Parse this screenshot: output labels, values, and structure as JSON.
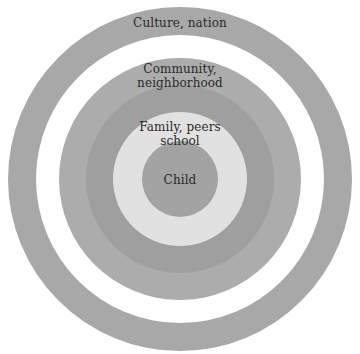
{
  "diagram": {
    "type": "concentric-circles",
    "center": {
      "x": 180,
      "y": 179
    },
    "layers": [
      {
        "id": "culture",
        "label": "Culture, nation",
        "lines": [
          "Culture, nation"
        ],
        "radius": 172,
        "color": "#a8a8a8"
      },
      {
        "id": "gap",
        "label": "",
        "lines": [],
        "radius": 144,
        "color": "#ffffff"
      },
      {
        "id": "community",
        "label": "Community, neighborhood",
        "lines": [
          "Community,",
          "neighborhood"
        ],
        "radius": 121,
        "color": "#acacac"
      },
      {
        "id": "family-outer",
        "label": "",
        "lines": [],
        "radius": 94,
        "color": "#9f9f9f"
      },
      {
        "id": "family",
        "label": "Family, peers school",
        "lines": [
          "Family, peers",
          "school"
        ],
        "radius": 67,
        "color": "#e1e1e1"
      },
      {
        "id": "child",
        "label": "Child",
        "lines": [
          "Child"
        ],
        "radius": 38,
        "color": "#a3a3a3"
      }
    ]
  },
  "labels": {
    "culture": "Culture, nation",
    "community_line1": "Community,",
    "community_line2": "neighborhood",
    "family_line1": "Family, peers",
    "family_line2": "school",
    "child": "Child"
  }
}
